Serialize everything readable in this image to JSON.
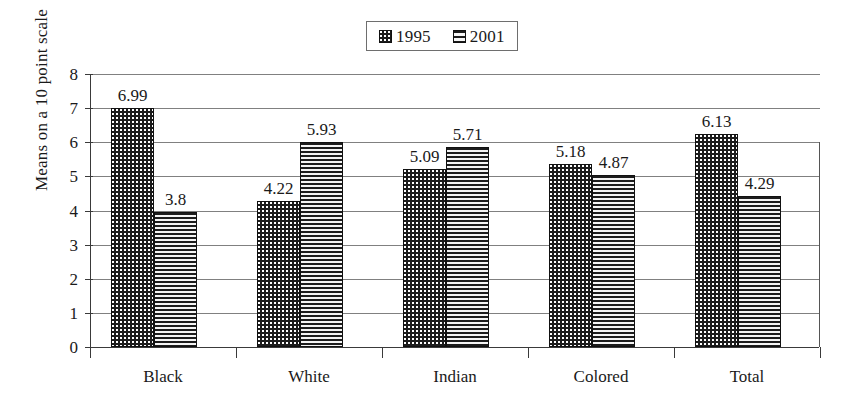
{
  "chart_data": {
    "type": "bar",
    "title": "",
    "subtitle": "",
    "xlabel": "",
    "ylabel": "Means on a 10 point scale",
    "categories": [
      "Black",
      "White",
      "Indian",
      "Colored",
      "Total"
    ],
    "series": [
      {
        "name": "1995",
        "swatch": "checkered-dots-pattern",
        "values": [
          6.99,
          4.22,
          5.09,
          5.18,
          6.13
        ],
        "labels": [
          "6.99",
          "4.22",
          "5.09",
          "5.18",
          "6.13"
        ],
        "plotted_heights": [
          7.0,
          4.27,
          5.22,
          5.37,
          6.25
        ]
      },
      {
        "name": "2001",
        "swatch": "horizontal-lines-pattern",
        "values": [
          3.8,
          5.93,
          5.71,
          4.87,
          4.29
        ],
        "labels": [
          "3.8",
          "5.93",
          "5.71",
          "4.87",
          "4.29"
        ],
        "plotted_heights": [
          3.95,
          6.02,
          5.85,
          5.03,
          4.43
        ]
      }
    ],
    "ylim": [
      0,
      8
    ],
    "yticks": [
      0,
      1,
      2,
      3,
      4,
      5,
      6,
      7,
      8
    ],
    "ytick_labels": [
      "0",
      "1",
      "2",
      "3",
      "4",
      "5",
      "6",
      "7",
      "8"
    ],
    "grid": "horizontal",
    "legend_position": "top-center",
    "colors": {
      "bar_outline": "#111111",
      "series_1995_fill": "#1c1c1c",
      "series_2001_fill": "#e9e9e9",
      "gridline": "#808080",
      "axis": "#3a3a3a",
      "text": "#1a1a1a",
      "background": "#ffffff"
    }
  },
  "legend": {
    "entries": [
      {
        "label": "1995"
      },
      {
        "label": "2001"
      }
    ]
  }
}
